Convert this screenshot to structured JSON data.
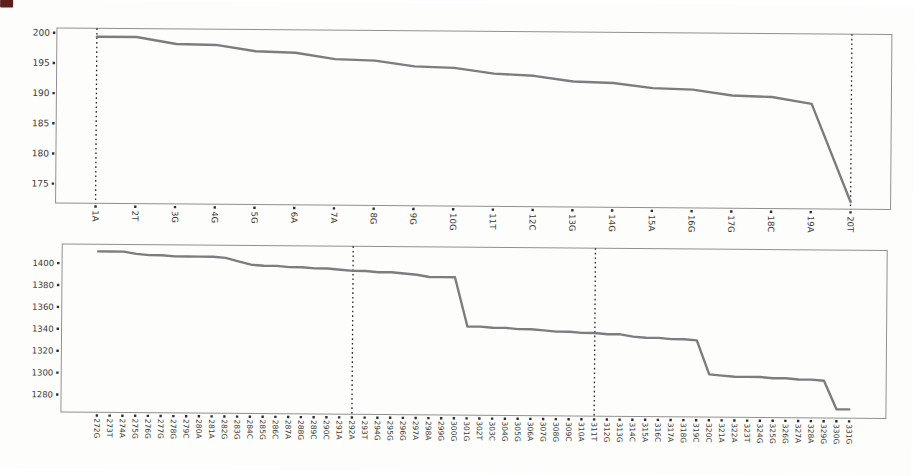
{
  "figure": {
    "description_visible_text_only": true,
    "artifact_color": "#5e1f1a"
  },
  "chart_data": [
    {
      "type": "line",
      "title": "",
      "xlabel": "",
      "ylabel": "",
      "categories": [
        "1A",
        "2T",
        "3G",
        "4G",
        "5G",
        "6A",
        "7A",
        "8G",
        "9G",
        "10G",
        "11T",
        "12C",
        "13G",
        "14G",
        "15A",
        "16G",
        "17G",
        "18C",
        "19A",
        "20T"
      ],
      "values": [
        199.4,
        199.4,
        198.3,
        198.2,
        197.2,
        197.0,
        196.0,
        195.8,
        194.9,
        194.7,
        193.8,
        193.5,
        192.6,
        192.4,
        191.6,
        191.4,
        190.5,
        190.3,
        189.2,
        173.0
      ],
      "yticks": [
        200,
        195,
        190,
        185,
        180,
        175
      ],
      "ylim": [
        171.8,
        200.8
      ],
      "vlines": [
        "1A",
        "20T"
      ],
      "grid": false,
      "legend": "none",
      "line_color": "#7d7d7d",
      "axis_color": "#909090",
      "tick_color": "#2f2f2f",
      "vline_color": "#262626"
    },
    {
      "type": "line",
      "title": "",
      "xlabel": "",
      "ylabel": "",
      "categories": [
        "272G",
        "273T",
        "274A",
        "275G",
        "276G",
        "277G",
        "278G",
        "279C",
        "280A",
        "281A",
        "282G",
        "283G",
        "284C",
        "285G",
        "286C",
        "287A",
        "288G",
        "289C",
        "290C",
        "291A",
        "292A",
        "293T",
        "294G",
        "295G",
        "296G",
        "297A",
        "298A",
        "299G",
        "300G",
        "301G",
        "302T",
        "303C",
        "304G",
        "305G",
        "306A",
        "307G",
        "308G",
        "309C",
        "310A",
        "311T",
        "312G",
        "313G",
        "314C",
        "315A",
        "316C",
        "317A",
        "318G",
        "319C",
        "320C",
        "321A",
        "322A",
        "323T",
        "324G",
        "325G",
        "326G",
        "327A",
        "328A",
        "329G",
        "330G",
        "331G"
      ],
      "values": [
        1411,
        1411,
        1411,
        1409,
        1408,
        1408,
        1407,
        1407,
        1407,
        1407,
        1406,
        1403,
        1400,
        1399,
        1399,
        1398,
        1398,
        1397,
        1397,
        1396,
        1395,
        1395,
        1394,
        1394,
        1393,
        1392,
        1390,
        1390,
        1390,
        1345,
        1345,
        1344,
        1344,
        1343,
        1343,
        1342,
        1341,
        1341,
        1340,
        1340,
        1339,
        1339,
        1337,
        1336,
        1336,
        1335,
        1335,
        1334,
        1303,
        1302,
        1301,
        1301,
        1301,
        1300,
        1300,
        1299,
        1299,
        1298,
        1272,
        1272
      ],
      "yticks": [
        1400,
        1380,
        1360,
        1340,
        1320,
        1300,
        1280
      ],
      "ylim": [
        1264,
        1417.5
      ],
      "vlines": [
        "292A",
        "311T"
      ],
      "grid": false,
      "legend": "none",
      "line_color": "#7d7d7d",
      "axis_color": "#909090",
      "tick_color": "#2f2f2f",
      "vline_color": "#262626"
    }
  ]
}
